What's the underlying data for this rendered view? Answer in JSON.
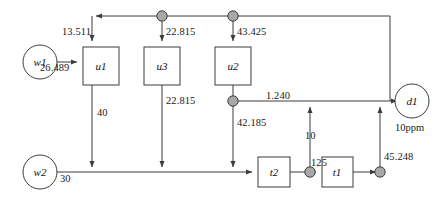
{
  "diagram": {
    "stroke_color": "#3c3c3c",
    "node_fill": "#a8a8a8",
    "box_fill": "#ffffff",
    "sources": [
      {
        "id": "w1",
        "label": "w1"
      },
      {
        "id": "w2",
        "label": "w2"
      }
    ],
    "units": [
      {
        "id": "u1",
        "label": "u1"
      },
      {
        "id": "u3",
        "label": "u3"
      },
      {
        "id": "u2",
        "label": "u2"
      }
    ],
    "treatments": [
      {
        "id": "t2",
        "label": "t2"
      },
      {
        "id": "t1",
        "label": "t1"
      }
    ],
    "sinks": [
      {
        "id": "d1",
        "label": "d1",
        "spec": "10ppm"
      }
    ],
    "flows": {
      "w1_to_u1": "26.489",
      "recycle_to_u1": "13.511",
      "split_to_u3": "22.815",
      "split_to_u2": "43.425",
      "u1_to_main": "40",
      "u3_to_main": "22.815",
      "u2_split_right": "1.240",
      "u2_split_down": "42.185",
      "w2_to_main": "30",
      "t2_to_t1": "125",
      "t1_node_up": "10",
      "t1_out_to_d1": "45.248"
    }
  }
}
